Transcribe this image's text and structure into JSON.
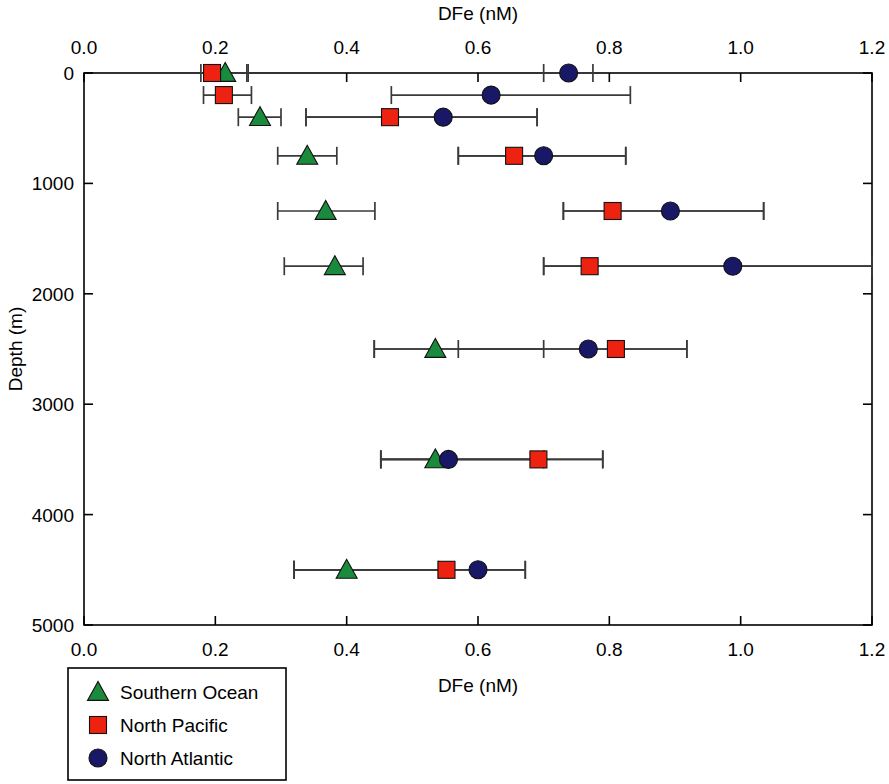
{
  "chart_data": {
    "type": "scatter",
    "title": "",
    "xlabel": "DFe (nM)",
    "ylabel": "Depth (m)",
    "xlabel_top": "DFe (nM)",
    "xlim": [
      0.0,
      1.2
    ],
    "ylim": [
      0,
      5000
    ],
    "y_inverted": true,
    "grid": false,
    "x_ticks": [
      "0.0",
      "0.2",
      "0.4",
      "0.6",
      "0.8",
      "1.0",
      "1.2"
    ],
    "x_tick_values": [
      0.0,
      0.2,
      0.4,
      0.6,
      0.8,
      1.0,
      1.2
    ],
    "y_ticks": [
      "0",
      "1000",
      "2000",
      "3000",
      "4000",
      "5000"
    ],
    "y_tick_values": [
      0,
      1000,
      2000,
      3000,
      4000,
      5000
    ],
    "legend_position": "below-left",
    "series": [
      {
        "name": "Southern Ocean",
        "marker": "triangle",
        "color": "#1a8a3c",
        "points": [
          {
            "depth": 0,
            "dfe": 0.215,
            "err_low": 0.185,
            "err_high": 0.25
          },
          {
            "depth": 400,
            "dfe": 0.268,
            "err_low": 0.235,
            "err_high": 0.3
          },
          {
            "depth": 750,
            "dfe": 0.34,
            "err_low": 0.295,
            "err_high": 0.385
          },
          {
            "depth": 1250,
            "dfe": 0.368,
            "err_low": 0.295,
            "err_high": 0.443
          },
          {
            "depth": 1750,
            "dfe": 0.382,
            "err_low": 0.305,
            "err_high": 0.425
          },
          {
            "depth": 2500,
            "dfe": 0.535,
            "err_low": 0.442,
            "err_high": 0.7
          },
          {
            "depth": 3500,
            "dfe": 0.535,
            "err_low": 0.452,
            "err_high": 0.7
          },
          {
            "depth": 4500,
            "dfe": 0.4,
            "err_low": 0.32,
            "err_high": 0.54
          }
        ]
      },
      {
        "name": "North Pacific",
        "marker": "square",
        "color": "#ee2211",
        "points": [
          {
            "depth": 0,
            "dfe": 0.195,
            "err_low": 0.178,
            "err_high": 0.248
          },
          {
            "depth": 200,
            "dfe": 0.213,
            "err_low": 0.182,
            "err_high": 0.255
          },
          {
            "depth": 400,
            "dfe": 0.466,
            "err_low": 0.338,
            "err_high": 0.69
          },
          {
            "depth": 750,
            "dfe": 0.655,
            "err_low": 0.57,
            "err_high": 0.825
          },
          {
            "depth": 1250,
            "dfe": 0.805,
            "err_low": 0.73,
            "err_high": 1.035
          },
          {
            "depth": 1750,
            "dfe": 0.77,
            "err_low": 0.7,
            "err_high": 1.2
          },
          {
            "depth": 2500,
            "dfe": 0.81,
            "err_low": 0.57,
            "err_high": 0.918
          },
          {
            "depth": 3500,
            "dfe": 0.692,
            "err_low": 0.452,
            "err_high": 0.79
          },
          {
            "depth": 4500,
            "dfe": 0.552,
            "err_low": 0.32,
            "err_high": 0.672
          }
        ]
      },
      {
        "name": "North Atlantic",
        "marker": "circle",
        "color": "#181866",
        "points": [
          {
            "depth": 0,
            "dfe": 0.738,
            "err_low": 0.7,
            "err_high": 0.775
          },
          {
            "depth": 200,
            "dfe": 0.62,
            "err_low": 0.468,
            "err_high": 0.832
          },
          {
            "depth": 400,
            "dfe": 0.547,
            "err_low": 0.338,
            "err_high": 0.69
          },
          {
            "depth": 750,
            "dfe": 0.7,
            "err_low": 0.57,
            "err_high": 0.825
          },
          {
            "depth": 1250,
            "dfe": 0.893,
            "err_low": 0.73,
            "err_high": 1.035
          },
          {
            "depth": 1750,
            "dfe": 0.988,
            "err_low": 0.7,
            "err_high": 1.2
          },
          {
            "depth": 2500,
            "dfe": 0.768,
            "err_low": 0.442,
            "err_high": 0.918
          },
          {
            "depth": 3500,
            "dfe": 0.555,
            "err_low": 0.452,
            "err_high": 0.79
          },
          {
            "depth": 4500,
            "dfe": 0.6,
            "err_low": 0.32,
            "err_high": 0.672
          }
        ]
      }
    ]
  },
  "legend": {
    "items": [
      {
        "label": "Southern Ocean",
        "marker": "triangle",
        "color": "#1a8a3c"
      },
      {
        "label": "North Pacific",
        "marker": "square",
        "color": "#ee2211"
      },
      {
        "label": "North Atlantic",
        "marker": "circle",
        "color": "#181866"
      }
    ]
  }
}
